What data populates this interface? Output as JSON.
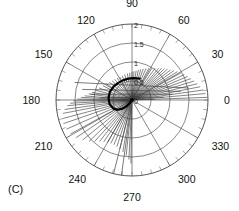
{
  "figure": {
    "caption": "(C)",
    "panel_label": "(C)"
  },
  "chart_data": {
    "type": "scatter",
    "subtype": "polar",
    "title": "",
    "xlabel": "",
    "ylabel": "",
    "grid": true,
    "legend": false,
    "angular_unit": "degrees",
    "angular_tick_labels": [
      "0",
      "30",
      "60",
      "90",
      "120",
      "150",
      "180",
      "210",
      "240",
      "270",
      "300",
      "330"
    ],
    "angular_ticks": [
      0,
      30,
      60,
      90,
      120,
      150,
      180,
      210,
      240,
      270,
      300,
      330
    ],
    "radial_tick_labels": [
      "0",
      "0.5",
      "1",
      "1.5",
      "2"
    ],
    "radial_ticks": [
      0,
      0.5,
      1,
      1.5,
      2
    ],
    "rlim": [
      0,
      2
    ],
    "radial_label_angle": 90,
    "series": [
      {
        "name": "radial-rays",
        "style": "line",
        "color": "#333333",
        "description": "line segments drawn from origin outward to each data point",
        "points": [
          {
            "theta": 2,
            "r": 1.97
          },
          {
            "theta": 5,
            "r": 1.93
          },
          {
            "theta": 8,
            "r": 1.88
          },
          {
            "theta": 11,
            "r": 1.82
          },
          {
            "theta": 14,
            "r": 1.76
          },
          {
            "theta": 17,
            "r": 1.7
          },
          {
            "theta": 20,
            "r": 1.64
          },
          {
            "theta": 23,
            "r": 1.58
          },
          {
            "theta": 26,
            "r": 1.52
          },
          {
            "theta": 29,
            "r": 1.46
          },
          {
            "theta": 32,
            "r": 1.4
          },
          {
            "theta": 35,
            "r": 1.34
          },
          {
            "theta": 38,
            "r": 1.28
          },
          {
            "theta": 41,
            "r": 1.23
          },
          {
            "theta": 44,
            "r": 1.18
          },
          {
            "theta": 47,
            "r": 1.13
          },
          {
            "theta": 50,
            "r": 1.08
          },
          {
            "theta": 54,
            "r": 1.03
          },
          {
            "theta": 58,
            "r": 0.98
          },
          {
            "theta": 62,
            "r": 0.94
          },
          {
            "theta": 66,
            "r": 0.9
          },
          {
            "theta": 70,
            "r": 0.86
          },
          {
            "theta": 74,
            "r": 0.83
          },
          {
            "theta": 78,
            "r": 0.8
          },
          {
            "theta": 82,
            "r": 0.77
          },
          {
            "theta": 86,
            "r": 0.75
          },
          {
            "theta": 90,
            "r": 0.73
          },
          {
            "theta": 95,
            "r": 0.71
          },
          {
            "theta": 100,
            "r": 0.7
          },
          {
            "theta": 106,
            "r": 0.69
          },
          {
            "theta": 112,
            "r": 0.68
          },
          {
            "theta": 118,
            "r": 0.68
          },
          {
            "theta": 124,
            "r": 0.69
          },
          {
            "theta": 130,
            "r": 0.7
          },
          {
            "theta": 136,
            "r": 0.72
          },
          {
            "theta": 142,
            "r": 0.75
          },
          {
            "theta": 148,
            "r": 0.79
          },
          {
            "theta": 154,
            "r": 0.84
          },
          {
            "theta": 160,
            "r": 0.91
          },
          {
            "theta": 165,
            "r": 0.98
          },
          {
            "theta": 169,
            "r": 1.06
          },
          {
            "theta": 172,
            "r": 1.14
          },
          {
            "theta": 175,
            "r": 1.24
          },
          {
            "theta": 177,
            "r": 1.33
          },
          {
            "theta": 179,
            "r": 1.43
          },
          {
            "theta": 181,
            "r": 1.53
          },
          {
            "theta": 183,
            "r": 1.62
          },
          {
            "theta": 185,
            "r": 1.7
          },
          {
            "theta": 188,
            "r": 1.78
          },
          {
            "theta": 191,
            "r": 1.84
          },
          {
            "theta": 195,
            "r": 1.88
          },
          {
            "theta": 199,
            "r": 1.9
          },
          {
            "theta": 204,
            "r": 1.88
          },
          {
            "theta": 209,
            "r": 1.84
          },
          {
            "theta": 214,
            "r": 1.76
          },
          {
            "theta": 219,
            "r": 1.66
          },
          {
            "theta": 224,
            "r": 1.56
          },
          {
            "theta": 228,
            "r": 1.46
          },
          {
            "theta": 232,
            "r": 1.38
          },
          {
            "theta": 236,
            "r": 1.32
          },
          {
            "theta": 240,
            "r": 1.28
          },
          {
            "theta": 244,
            "r": 1.26
          },
          {
            "theta": 248,
            "r": 1.26
          },
          {
            "theta": 252,
            "r": 1.28
          },
          {
            "theta": 256,
            "r": 1.32
          },
          {
            "theta": 260,
            "r": 1.38
          },
          {
            "theta": 264,
            "r": 1.46
          },
          {
            "theta": 267,
            "r": 1.56
          },
          {
            "theta": 269,
            "r": 1.66
          }
        ]
      },
      {
        "name": "inner-locus-arc",
        "style": "thick-curve",
        "color": "#000000",
        "description": "dark arc near the origin spanning roughly 90 to 230 degrees at small radius",
        "points": [
          {
            "theta": 70,
            "r": 0.6
          },
          {
            "theta": 85,
            "r": 0.58
          },
          {
            "theta": 100,
            "r": 0.57
          },
          {
            "theta": 115,
            "r": 0.57
          },
          {
            "theta": 130,
            "r": 0.58
          },
          {
            "theta": 145,
            "r": 0.6
          },
          {
            "theta": 160,
            "r": 0.62
          },
          {
            "theta": 175,
            "r": 0.62
          },
          {
            "theta": 190,
            "r": 0.6
          },
          {
            "theta": 205,
            "r": 0.54
          },
          {
            "theta": 215,
            "r": 0.45
          },
          {
            "theta": 222,
            "r": 0.34
          },
          {
            "theta": 228,
            "r": 0.22
          },
          {
            "theta": 234,
            "r": 0.1
          },
          {
            "theta": 240,
            "r": 0.02
          }
        ]
      },
      {
        "name": "horizontal-chords",
        "style": "line",
        "color": "#444444",
        "description": "near-horizontal segments crossing the left and right of the disc",
        "segments": [
          {
            "theta1": 163,
            "r1": 1.58,
            "theta2": 12,
            "r2": 1.52
          },
          {
            "theta1": 168,
            "r1": 1.34,
            "theta2": 10,
            "r2": 1.3
          },
          {
            "theta1": 172,
            "r1": 1.1,
            "theta2": 8,
            "r2": 1.08
          },
          {
            "theta1": 176,
            "r1": 0.86,
            "theta2": 5,
            "r2": 0.84
          },
          {
            "theta1": 180,
            "r1": 0.62,
            "theta2": 2,
            "r2": 0.6
          }
        ]
      },
      {
        "name": "vertical-tail",
        "style": "line",
        "color": "#555555",
        "description": "long near-vertical segment running downward past the 270 degree axis",
        "segments": [
          {
            "theta1": 262,
            "r1": 0.05,
            "theta2": 262,
            "r2": 2.0
          },
          {
            "theta1": 256,
            "r1": 0.05,
            "theta2": 256,
            "r2": 2.0
          }
        ]
      }
    ]
  },
  "geometry": {
    "cx": 132,
    "cy": 100,
    "radius": 76
  }
}
